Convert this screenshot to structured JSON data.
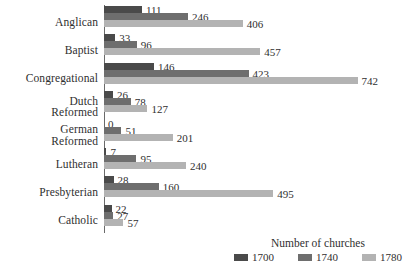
{
  "chart_data": {
    "type": "bar",
    "orientation": "horizontal",
    "title": "",
    "xlabel": "",
    "ylabel": "",
    "legend_title": "Number of churches",
    "legend_position": "bottom-right",
    "grid": false,
    "xlim": [
      0,
      742
    ],
    "categories": [
      "Anglican",
      "Baptist",
      "Congregational",
      "Dutch\nReformed",
      "German\nReformed",
      "Lutheran",
      "Presbyterian",
      "Catholic"
    ],
    "series": [
      {
        "name": "1700",
        "color": "#4a4a4a",
        "values": [
          111,
          33,
          146,
          26,
          0,
          7,
          28,
          22
        ]
      },
      {
        "name": "1740",
        "color": "#6e6e6e",
        "values": [
          246,
          96,
          423,
          78,
          51,
          95,
          160,
          27
        ]
      },
      {
        "name": "1780",
        "color": "#b3b3b3",
        "values": [
          406,
          457,
          742,
          127,
          201,
          240,
          495,
          57
        ]
      }
    ],
    "value_labels": {
      "Anglican": [
        "111",
        "246",
        "406"
      ],
      "Baptist": [
        "33",
        "96",
        "457"
      ],
      "Congregational": [
        "146",
        "423",
        "742"
      ],
      "Dutch Reformed": [
        "26",
        "78",
        "127"
      ],
      "German Reformed": [
        "0",
        "51",
        "201"
      ],
      "Lutheran": [
        "7",
        "95",
        "240"
      ],
      "Presbyterian": [
        "28",
        "160",
        "495"
      ],
      "Catholic": [
        "22",
        "27",
        "57"
      ]
    }
  }
}
